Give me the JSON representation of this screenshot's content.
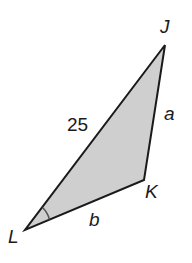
{
  "diagram": {
    "type": "triangle",
    "fill_color": "#cfcfcf",
    "stroke_color": "#1a1a1a",
    "vertices": [
      {
        "name": "J",
        "label": "J"
      },
      {
        "name": "K",
        "label": "K"
      },
      {
        "name": "L",
        "label": "L"
      }
    ],
    "sides": [
      {
        "between": "J-L",
        "label": "25"
      },
      {
        "between": "J-K",
        "label": "a"
      },
      {
        "between": "K-L",
        "label": "b"
      }
    ],
    "marked_angle": "L"
  }
}
